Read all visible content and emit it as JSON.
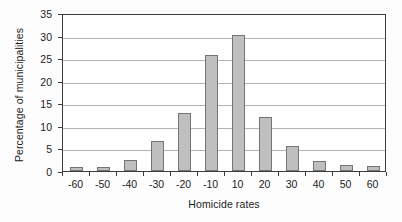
{
  "chart_data": {
    "type": "bar",
    "title": "",
    "xlabel": "Homicide rates",
    "ylabel": "Percentage of municipalities",
    "categories": [
      "-60",
      "-50",
      "-40",
      "-30",
      "-20",
      "-10",
      "10",
      "20",
      "30",
      "40",
      "50",
      "60"
    ],
    "values": [
      0.8,
      1.0,
      2.4,
      6.6,
      12.9,
      25.7,
      30.2,
      11.9,
      5.5,
      2.2,
      1.4,
      1.1
    ],
    "ylim": [
      0,
      35
    ],
    "yticks": [
      0,
      5,
      10,
      15,
      20,
      25,
      30,
      35
    ],
    "ytick_labels": [
      "0",
      "5",
      "10",
      "15",
      "20",
      "25",
      "30",
      "35"
    ],
    "grid": "horizontal",
    "legend": "none",
    "bar_color": "#bfbfbf",
    "bar_edge_color": "#757575",
    "axis_color": "#3d3d3d",
    "gridline_color": "#b4b4b4",
    "background_color": "#fdfdfd",
    "text_color": "#1c1c1c"
  }
}
